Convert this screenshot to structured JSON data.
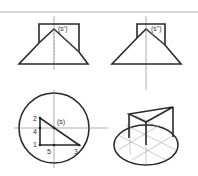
{
  "figure": {
    "front_view": {
      "label": "(s')"
    },
    "side_view": {
      "label": "(s\")"
    },
    "top_view": {
      "label": "(s)",
      "points": [
        "1",
        "2",
        "3",
        "4",
        "5"
      ]
    },
    "iso_view": {}
  },
  "colors": {
    "line": "#2a2a2a",
    "axis": "#777777"
  }
}
